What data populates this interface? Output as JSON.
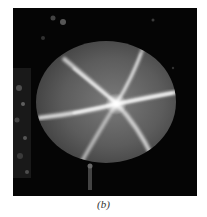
{
  "figure": {
    "caption": "(b)",
    "colors": {
      "background": "#050505",
      "gem_body": "#5a5a5a",
      "star_rays": "#f2f2f2",
      "page": "#ffffff"
    }
  }
}
